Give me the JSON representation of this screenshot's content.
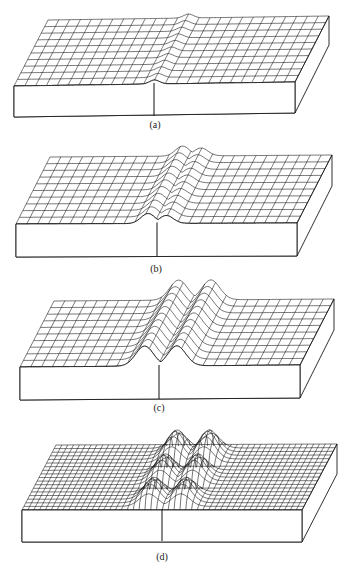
{
  "figure": {
    "colors": {
      "ink": "#1a1a1a",
      "paper": "#ffffff"
    },
    "panels": [
      {
        "id": "a",
        "label": "(a)",
        "label_pos": [
          155,
          125
        ],
        "back_left": [
          48,
          20
        ],
        "back_right": [
          329,
          16
        ],
        "front_left": [
          14,
          86
        ],
        "front_right": [
          295,
          82
        ],
        "thickness": 31,
        "crack_x_front": 154,
        "grid": {
          "cols": 26,
          "rows": 10
        },
        "feature": "slight flexure along crack",
        "bumps": [
          {
            "u": 0.5,
            "w": 0.025,
            "h": 4,
            "v0": 0,
            "v1": 1
          }
        ]
      },
      {
        "id": "b",
        "label": "(b)",
        "label_pos": [
          156,
          269
        ],
        "back_left": [
          50,
          157
        ],
        "back_right": [
          332,
          155
        ],
        "front_left": [
          16,
          224
        ],
        "front_right": [
          297,
          223
        ],
        "thickness": 33,
        "crack_x_front": 157,
        "grid": {
          "cols": 26,
          "rows": 10
        },
        "feature": "low ridge on both sides of crack",
        "bumps": [
          {
            "u": 0.47,
            "w": 0.035,
            "h": 10,
            "v0": 0,
            "v1": 1
          },
          {
            "u": 0.535,
            "w": 0.035,
            "h": 8,
            "v0": 0,
            "v1": 1
          }
        ]
      },
      {
        "id": "c",
        "label": "(c)",
        "label_pos": [
          159,
          408
        ],
        "back_left": [
          54,
          301
        ],
        "back_right": [
          334,
          299
        ],
        "front_left": [
          20,
          367
        ],
        "front_right": [
          300,
          365
        ],
        "thickness": 33,
        "crack_x_front": 159,
        "grid": {
          "cols": 26,
          "rows": 10
        },
        "feature": "two high parallel ridges flanking crack",
        "bumps": [
          {
            "u": 0.445,
            "w": 0.045,
            "h": 20,
            "v0": 0,
            "v1": 1
          },
          {
            "u": 0.56,
            "w": 0.045,
            "h": 20,
            "v0": 0,
            "v1": 1
          }
        ]
      },
      {
        "id": "d",
        "label": "(d)",
        "label_pos": [
          162,
          557
        ],
        "back_left": [
          56,
          445
        ],
        "back_right": [
          337,
          444
        ],
        "front_left": [
          22,
          510
        ],
        "front_right": [
          302,
          510
        ],
        "thickness": 32,
        "crack_x_front": 162,
        "grid": {
          "cols": 48,
          "rows": 18
        },
        "feature": "ridges broken into rows of domes",
        "bumps": [
          {
            "u": 0.445,
            "w": 0.045,
            "h": 20,
            "v0": 0.0,
            "v1": 0.33
          },
          {
            "u": 0.56,
            "w": 0.045,
            "h": 20,
            "v0": 0.0,
            "v1": 0.33
          },
          {
            "u": 0.445,
            "w": 0.045,
            "h": 22,
            "v0": 0.33,
            "v1": 0.66
          },
          {
            "u": 0.56,
            "w": 0.045,
            "h": 22,
            "v0": 0.33,
            "v1": 0.66
          },
          {
            "u": 0.445,
            "w": 0.045,
            "h": 24,
            "v0": 0.66,
            "v1": 1.0
          },
          {
            "u": 0.56,
            "w": 0.045,
            "h": 24,
            "v0": 0.66,
            "v1": 1.0
          }
        ]
      }
    ]
  }
}
